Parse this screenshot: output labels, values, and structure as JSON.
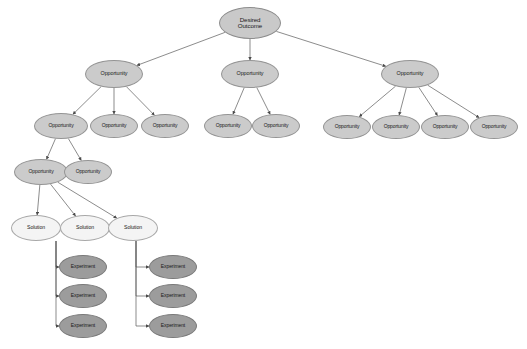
{
  "diagram": {
    "background_color": "#ffffff",
    "node_kinds": {
      "outcome": {
        "label": "Desired Outcome",
        "fill": "#c9c9c9",
        "stroke": "#8d8d8d"
      },
      "opportunity": {
        "label": "Opportunity",
        "fill": "#cbcbcb",
        "stroke": "#949494"
      },
      "solution": {
        "label": "Solution",
        "fill": "#f4f4f4",
        "stroke": "#a8a8a8"
      },
      "experiment": {
        "label": "Experiment",
        "fill": "#9c9c9c",
        "stroke": "#7a7a7a"
      }
    },
    "edge_color": "#5a5a5a"
  },
  "nodes": [
    {
      "id": "outcome",
      "kind": "outcome",
      "label": "Desired\nOutcome",
      "cx": 250,
      "cy": 23,
      "rx": 31,
      "ry": 16,
      "fs": 6.2
    },
    {
      "id": "opp_l",
      "kind": "opportunity",
      "label": "Opportunity",
      "cx": 114,
      "cy": 74,
      "rx": 29,
      "ry": 14,
      "fs": 5.4
    },
    {
      "id": "opp_m",
      "kind": "opportunity",
      "label": "Opportunity",
      "cx": 250,
      "cy": 74,
      "rx": 29,
      "ry": 14,
      "fs": 5.4
    },
    {
      "id": "opp_r",
      "kind": "opportunity",
      "label": "Opportunity",
      "cx": 410,
      "cy": 74,
      "rx": 29,
      "ry": 14,
      "fs": 5.4
    },
    {
      "id": "opp_l1",
      "kind": "opportunity",
      "label": "Opportunity",
      "cx": 61,
      "cy": 126,
      "rx": 27,
      "ry": 13,
      "fs": 5.1
    },
    {
      "id": "opp_l2",
      "kind": "opportunity",
      "label": "Opportunity",
      "cx": 114,
      "cy": 126,
      "rx": 24,
      "ry": 12,
      "fs": 5.0
    },
    {
      "id": "opp_l3",
      "kind": "opportunity",
      "label": "Opportunity",
      "cx": 165,
      "cy": 126,
      "rx": 24,
      "ry": 12,
      "fs": 5.0
    },
    {
      "id": "opp_m1",
      "kind": "opportunity",
      "label": "Opportunity",
      "cx": 228,
      "cy": 126,
      "rx": 24,
      "ry": 12,
      "fs": 5.0
    },
    {
      "id": "opp_m2",
      "kind": "opportunity",
      "label": "Opportunity",
      "cx": 276,
      "cy": 126,
      "rx": 24,
      "ry": 12,
      "fs": 5.0
    },
    {
      "id": "opp_r1",
      "kind": "opportunity",
      "label": "Opportunity",
      "cx": 347,
      "cy": 127,
      "rx": 24,
      "ry": 12,
      "fs": 5.0
    },
    {
      "id": "opp_r2",
      "kind": "opportunity",
      "label": "Opportunity",
      "cx": 396,
      "cy": 127,
      "rx": 24,
      "ry": 12,
      "fs": 5.0
    },
    {
      "id": "opp_r3",
      "kind": "opportunity",
      "label": "Opportunity",
      "cx": 445,
      "cy": 127,
      "rx": 24,
      "ry": 12,
      "fs": 5.0
    },
    {
      "id": "opp_r4",
      "kind": "opportunity",
      "label": "Opportunity",
      "cx": 494,
      "cy": 127,
      "rx": 24,
      "ry": 12,
      "fs": 5.0
    },
    {
      "id": "opp_ll1",
      "kind": "opportunity",
      "label": "Opportunity",
      "cx": 41,
      "cy": 172,
      "rx": 27,
      "ry": 13,
      "fs": 5.1
    },
    {
      "id": "opp_ll2",
      "kind": "opportunity",
      "label": "Opportunity",
      "cx": 88,
      "cy": 172,
      "rx": 24,
      "ry": 12,
      "fs": 5.0
    },
    {
      "id": "sol_1",
      "kind": "solution",
      "label": "Solution",
      "cx": 36,
      "cy": 228,
      "rx": 25,
      "ry": 13,
      "fs": 5.2
    },
    {
      "id": "sol_2",
      "kind": "solution",
      "label": "Solution",
      "cx": 85,
      "cy": 228,
      "rx": 25,
      "ry": 13,
      "fs": 5.2
    },
    {
      "id": "sol_3",
      "kind": "solution",
      "label": "Solution",
      "cx": 133,
      "cy": 228,
      "rx": 25,
      "ry": 13,
      "fs": 5.2
    },
    {
      "id": "exp_a1",
      "kind": "experiment",
      "label": "Experiment",
      "cx": 83,
      "cy": 267,
      "rx": 24,
      "ry": 12,
      "fs": 5.0
    },
    {
      "id": "exp_a2",
      "kind": "experiment",
      "label": "Experiment",
      "cx": 83,
      "cy": 296,
      "rx": 24,
      "ry": 12,
      "fs": 5.0
    },
    {
      "id": "exp_a3",
      "kind": "experiment",
      "label": "Experiment",
      "cx": 83,
      "cy": 326,
      "rx": 24,
      "ry": 12,
      "fs": 5.0
    },
    {
      "id": "exp_b1",
      "kind": "experiment",
      "label": "Experiment",
      "cx": 173,
      "cy": 267,
      "rx": 24,
      "ry": 12,
      "fs": 5.0
    },
    {
      "id": "exp_b2",
      "kind": "experiment",
      "label": "Experiment",
      "cx": 173,
      "cy": 296,
      "rx": 24,
      "ry": 12,
      "fs": 5.0
    },
    {
      "id": "exp_b3",
      "kind": "experiment",
      "label": "Experiment",
      "cx": 173,
      "cy": 326,
      "rx": 24,
      "ry": 12,
      "fs": 5.0
    }
  ],
  "edges_straight": [
    {
      "from": "outcome",
      "to": "opp_l"
    },
    {
      "from": "outcome",
      "to": "opp_m"
    },
    {
      "from": "outcome",
      "to": "opp_r"
    },
    {
      "from": "opp_l",
      "to": "opp_l1"
    },
    {
      "from": "opp_l",
      "to": "opp_l2"
    },
    {
      "from": "opp_l",
      "to": "opp_l3"
    },
    {
      "from": "opp_m",
      "to": "opp_m1"
    },
    {
      "from": "opp_m",
      "to": "opp_m2"
    },
    {
      "from": "opp_r",
      "to": "opp_r1"
    },
    {
      "from": "opp_r",
      "to": "opp_r2"
    },
    {
      "from": "opp_r",
      "to": "opp_r3"
    },
    {
      "from": "opp_r",
      "to": "opp_r4"
    },
    {
      "from": "opp_l1",
      "to": "opp_ll1"
    },
    {
      "from": "opp_l1",
      "to": "opp_ll2"
    },
    {
      "from": "opp_ll1",
      "to": "sol_1"
    },
    {
      "from": "opp_ll1",
      "to": "sol_2"
    },
    {
      "from": "opp_ll1",
      "to": "sol_3"
    }
  ],
  "edges_ortho": [
    {
      "from": "sol_1",
      "to": "exp_a1",
      "bus_x": 56
    },
    {
      "from": "sol_1",
      "to": "exp_a2",
      "bus_x": 56
    },
    {
      "from": "sol_1",
      "to": "exp_a3",
      "bus_x": 56
    },
    {
      "from": "sol_3",
      "to": "exp_b1",
      "bus_x": 136
    },
    {
      "from": "sol_3",
      "to": "exp_b2",
      "bus_x": 136
    },
    {
      "from": "sol_3",
      "to": "exp_b3",
      "bus_x": 136
    }
  ]
}
